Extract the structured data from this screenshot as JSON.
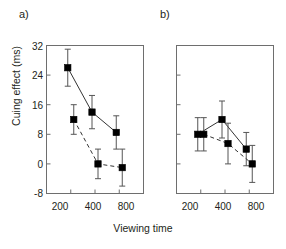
{
  "figure": {
    "panel_a_label": "a)",
    "panel_b_label": "b)",
    "xlabel": "Viewing time",
    "ylabel": "Cuing effect (ms)"
  },
  "axis": {
    "y_ticks": [
      "32",
      "24",
      "16",
      "8",
      "0",
      "-8"
    ],
    "x_ticks": [
      "200",
      "400",
      "800"
    ]
  },
  "chart_data": {
    "type": "line",
    "title": "",
    "xlabel": "Viewing time",
    "ylabel": "Cuing effect (ms)",
    "categories": [
      "200",
      "400",
      "800"
    ],
    "ylim": [
      -8,
      32
    ],
    "yticks": [
      -8,
      0,
      8,
      16,
      24,
      32
    ],
    "grid": false,
    "legend": "none",
    "marker": "filled-square",
    "panels": [
      {
        "label": "a)",
        "series": [
          {
            "name": "solid",
            "line_style": "solid",
            "values": [
              26,
              14,
              8.5
            ],
            "err_low": [
              5,
              4.5,
              4.5
            ],
            "err_high": [
              5,
              4.5,
              4.5
            ]
          },
          {
            "name": "dashed",
            "line_style": "dashed",
            "values": [
              12,
              0,
              -1
            ],
            "err_low": [
              4,
              4,
              5
            ],
            "err_high": [
              4,
              4,
              5
            ]
          }
        ]
      },
      {
        "label": "b)",
        "series": [
          {
            "name": "solid",
            "line_style": "solid",
            "values": [
              8,
              12,
              4
            ],
            "err_low": [
              4.5,
              5,
              4.5
            ],
            "err_high": [
              4.5,
              5,
              4.5
            ]
          },
          {
            "name": "dashed",
            "line_style": "dashed",
            "values": [
              8,
              5.5,
              0
            ],
            "err_low": [
              4.5,
              5.5,
              5
            ],
            "err_high": [
              4.5,
              5.5,
              5
            ]
          }
        ]
      }
    ]
  },
  "colors": {
    "axis": "#6e6e6e",
    "marker": "#000000",
    "line": "#333333",
    "text": "#231f20"
  }
}
